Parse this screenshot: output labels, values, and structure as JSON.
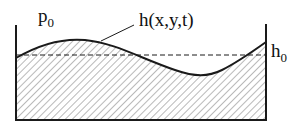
{
  "diagram": {
    "labels": {
      "ambient_pressure": "p",
      "ambient_pressure_sub": "0",
      "surface_height": "h(x,y,t)",
      "mean_depth": "h",
      "mean_depth_sub": "0"
    },
    "colors": {
      "stroke": "#1a1a1a",
      "hatch": "#8a8a8a",
      "background": "#ffffff"
    },
    "elements": {
      "container": "open rectangular tank (left wall, right wall, bottom)",
      "free_surface": "wavy solid curve",
      "mean_level": "horizontal dashed line",
      "fluid": "diagonal hatched region"
    }
  }
}
